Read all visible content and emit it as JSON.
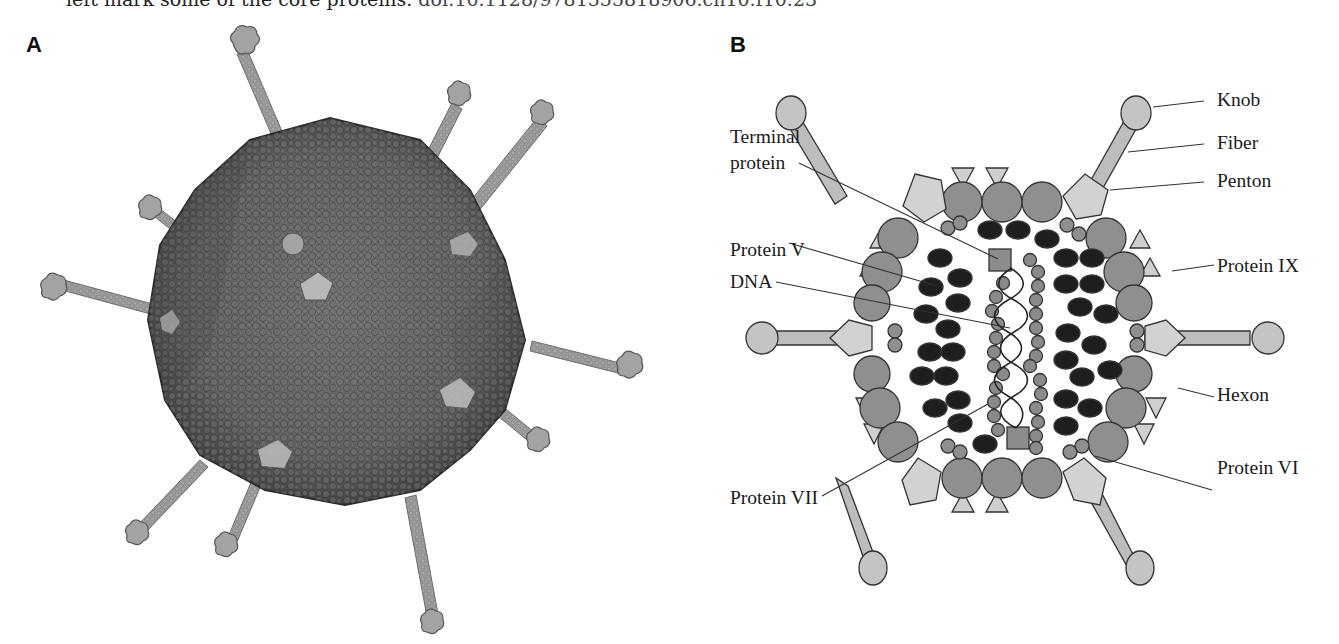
{
  "caption": {
    "text": "left mark some of the core proteins. ",
    "doi": "doi:10.1128/9781555818906.ch10.f10.23"
  },
  "panels": [
    {
      "id": "A",
      "letter": "A",
      "description": "Space-filling molecular model of adenovirus particle with protruding fibers"
    },
    {
      "id": "B",
      "letter": "B",
      "description": "Schematic cross-section of adenovirus particle",
      "labels": {
        "knob": "Knob",
        "fiber": "Fiber",
        "penton": "Penton",
        "terminal_protein_line1": "Terminal",
        "terminal_protein_line2": "protein",
        "protein_v": "Protein V",
        "protein_ix": "Protein IX",
        "dna": "DNA",
        "hexon": "Hexon",
        "protein_vii": "Protein VII",
        "protein_vi": "Protein VI"
      }
    }
  ],
  "colors": {
    "hexon": "#8f8f8f",
    "penton": "#d2d2d2",
    "knob": "#c4c4c4",
    "fiber": "#bdbdbd",
    "protein_ix": "#cfcfcf",
    "protein_v": "#1e1e1e",
    "protein_vii": "#8a8a8a",
    "terminal_protein": "#8c8c8c",
    "capsid_model": "#6a6a6a",
    "fiber_model": "#9a9a9a"
  }
}
